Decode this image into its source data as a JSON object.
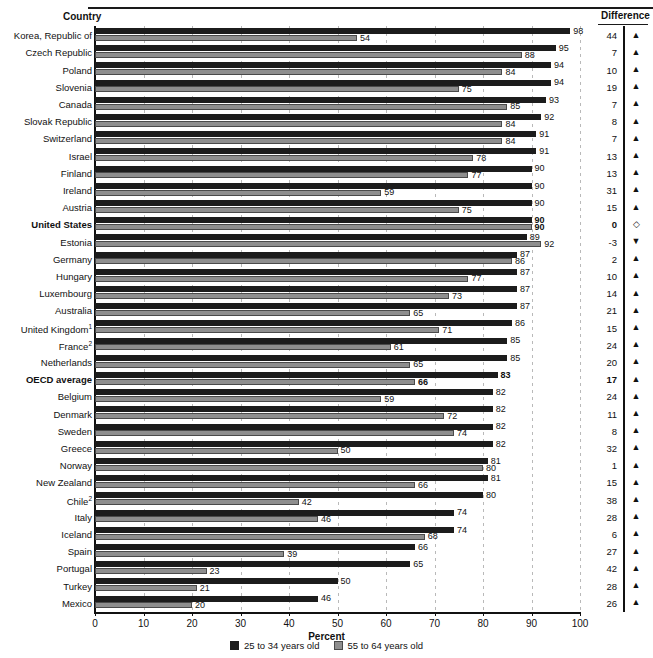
{
  "header": {
    "country_label": "Country",
    "difference_label": "Difference"
  },
  "axis": {
    "title": "Percent",
    "ticks": [
      "0",
      "10",
      "20",
      "30",
      "40",
      "50",
      "60",
      "70",
      "80",
      "90",
      "100"
    ]
  },
  "legend": {
    "items": [
      {
        "label": "25 to 34 years old",
        "color": "#1c1c1c",
        "key": "young"
      },
      {
        "label": "55 to 64 years old",
        "color": "#8e8e8e",
        "key": "old"
      }
    ]
  },
  "colors": {
    "young_bar": "#1c1c1c",
    "old_bar": "#8e8e8e",
    "axis": "#111111",
    "gridline": "#b9b9b9"
  },
  "symbols": {
    "up": "▲",
    "down": "▼",
    "equal": "◇"
  },
  "chart_data": {
    "type": "bar",
    "orientation": "horizontal",
    "title": "",
    "xlabel": "Percent",
    "ylabel": "Country",
    "xlim": [
      0,
      100
    ],
    "grid": true,
    "legend_position": "bottom",
    "categories": [
      "Korea, Republic of",
      "Czech Republic",
      "Poland",
      "Slovenia",
      "Canada",
      "Slovak Republic",
      "Switzerland",
      "Israel",
      "Finland",
      "Ireland",
      "Austria",
      "United States",
      "Estonia",
      "Germany",
      "Hungary",
      "Luxembourg",
      "Australia",
      "United Kingdom¹",
      "France²",
      "Netherlands",
      "OECD average",
      "Belgium",
      "Denmark",
      "Sweden",
      "Greece",
      "Norway",
      "New Zealand",
      "Chile²",
      "Italy",
      "Iceland",
      "Spain",
      "Portugal",
      "Turkey",
      "Mexico"
    ],
    "series": [
      {
        "name": "25 to 34 years old",
        "key": "young",
        "color": "#1c1c1c",
        "values": [
          98,
          95,
          94,
          94,
          93,
          92,
          91,
          91,
          90,
          90,
          90,
          90,
          89,
          87,
          87,
          87,
          87,
          86,
          85,
          85,
          83,
          82,
          82,
          82,
          82,
          81,
          81,
          80,
          74,
          74,
          66,
          65,
          50,
          46
        ]
      },
      {
        "name": "55 to 64 years old",
        "key": "old",
        "color": "#8e8e8e",
        "values": [
          54,
          88,
          84,
          75,
          85,
          84,
          84,
          78,
          77,
          59,
          75,
          90,
          92,
          86,
          77,
          73,
          65,
          71,
          61,
          65,
          66,
          59,
          72,
          74,
          50,
          80,
          66,
          42,
          46,
          68,
          39,
          23,
          21,
          20
        ]
      }
    ],
    "difference": [
      44,
      7,
      10,
      19,
      7,
      8,
      7,
      13,
      13,
      31,
      15,
      0,
      -3,
      2,
      10,
      14,
      21,
      15,
      24,
      20,
      17,
      24,
      11,
      8,
      32,
      1,
      15,
      38,
      28,
      6,
      27,
      42,
      28,
      26
    ],
    "difference_symbol": [
      "up",
      "up",
      "up",
      "up",
      "up",
      "up",
      "up",
      "up",
      "up",
      "up",
      "up",
      "equal",
      "down",
      "up",
      "up",
      "up",
      "up",
      "up",
      "up",
      "up",
      "up",
      "up",
      "up",
      "up",
      "up",
      "up",
      "up",
      "up",
      "up",
      "up",
      "up",
      "up",
      "up",
      "up"
    ],
    "highlight_rows": [
      "United States",
      "OECD average"
    ]
  }
}
